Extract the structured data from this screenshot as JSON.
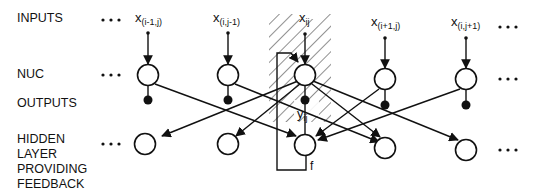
{
  "diagram": {
    "row_labels": {
      "inputs": "INPUTS",
      "nuc": "NUC",
      "outputs": "OUTPUTS",
      "hidden": "HIDDEN\nLAYER\nPROVIDING\nFEEDBACK"
    },
    "ellipsis": "• • •",
    "columns": [
      {
        "input_base": "x",
        "input_sub": "(i-1,j)",
        "x": 148
      },
      {
        "input_base": "x",
        "input_sub": "(i,j-1)",
        "x": 228
      },
      {
        "input_base": "x",
        "input_sub": "ij",
        "x": 305,
        "highlighted": true
      },
      {
        "input_base": "x",
        "input_sub": "(i+1,j)",
        "x": 385
      },
      {
        "input_base": "x",
        "input_sub": "(i,j+1)",
        "x": 463
      }
    ],
    "output_label": {
      "base": "y",
      "sub": "ij"
    },
    "feedback_label": "f",
    "colors": {
      "stroke": "#111111",
      "background": "#ffffff"
    }
  }
}
